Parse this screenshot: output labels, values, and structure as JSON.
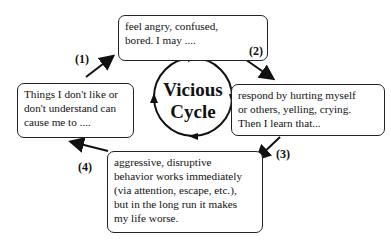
{
  "diagram": {
    "title": "Vicious Cycle",
    "center": {
      "line1": "Vicious",
      "line2": "Cycle"
    },
    "steps": [
      {
        "label": "(1)",
        "lines": [
          "Things I don't like or",
          "don't understand can",
          "cause me to ...."
        ]
      },
      {
        "label": "(2)",
        "lines": [
          "feel angry, confused,",
          "bored.   I may ...."
        ]
      },
      {
        "label": "(3)",
        "lines": [
          "respond by hurting myself",
          "or others, yelling, crying.",
          "Then I learn that..."
        ]
      },
      {
        "label": "(4)",
        "lines": [
          "aggressive, disruptive",
          "behavior works immediately",
          "(via attention, escape, etc.),",
          "but in the long run it makes",
          "my life worse."
        ]
      }
    ]
  }
}
